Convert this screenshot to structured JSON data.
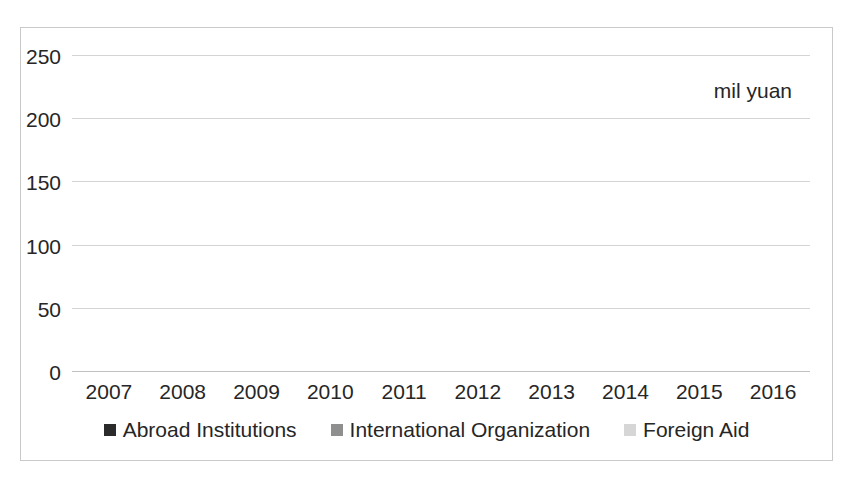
{
  "annotation": {
    "unit_note": "mil yuan"
  },
  "chart_data": {
    "type": "bar",
    "stacked": true,
    "title": "",
    "xlabel": "",
    "ylabel": "",
    "unit_note": "mil yuan",
    "grid": true,
    "legend_position": "bottom",
    "ylim": [
      0,
      250
    ],
    "yticks": [
      0,
      50,
      100,
      150,
      200,
      250
    ],
    "ytick_labels": [
      "0",
      "50",
      "100",
      "150",
      "200",
      "250"
    ],
    "categories": [
      "2007",
      "2008",
      "2009",
      "2010",
      "2011",
      "2012",
      "2013",
      "2014",
      "2015",
      "2016"
    ],
    "series": [
      {
        "name": "Abroad Institutions",
        "color": "#2b2b2b",
        "values": [
          11,
          11,
          152,
          34,
          11,
          10,
          10,
          13,
          11,
          11
        ]
      },
      {
        "name": "International Organization",
        "color": "#8f8f8f",
        "values": [
          8,
          8,
          9,
          2,
          9,
          19,
          11,
          24,
          24,
          29
        ]
      },
      {
        "name": "Foreign Aid",
        "color": "#d6d6d6",
        "values": [
          23,
          60,
          44,
          51,
          73,
          72,
          72,
          82,
          82,
          107
        ]
      }
    ],
    "totals": [
      42,
      79,
      205,
      87,
      93,
      101,
      93,
      119,
      117,
      147
    ]
  }
}
